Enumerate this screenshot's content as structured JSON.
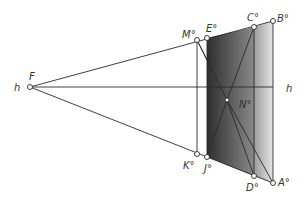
{
  "diagram": {
    "horizon_label": "h",
    "vanishing_point": {
      "label": "F",
      "x": 30,
      "y": 87
    },
    "points": {
      "M": {
        "label": "M°",
        "x": 197,
        "y": 40
      },
      "E": {
        "label": "E°",
        "x": 207,
        "y": 38
      },
      "C": {
        "label": "C°",
        "x": 254,
        "y": 27
      },
      "B": {
        "label": "B°",
        "x": 273,
        "y": 21
      },
      "K": {
        "label": "K°",
        "x": 197,
        "y": 154
      },
      "J": {
        "label": "J°",
        "x": 207,
        "y": 157
      },
      "D": {
        "label": "D°",
        "x": 254,
        "y": 176
      },
      "A": {
        "label": "A°",
        "x": 273,
        "y": 183
      },
      "N": {
        "label": "N°",
        "x": 227,
        "y": 100
      }
    },
    "colors": {
      "line": "#2a2a2a",
      "dark_face": "#3a3a3a",
      "light_face": "#cfcfcf"
    }
  }
}
